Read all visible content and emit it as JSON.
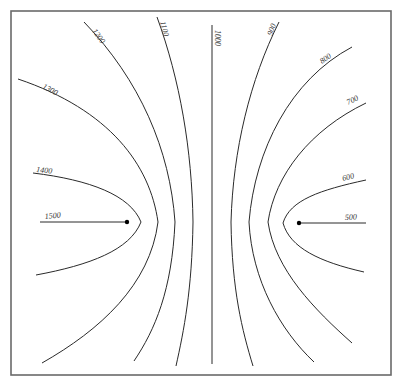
{
  "diagram": {
    "type": "contour-map",
    "frame": {
      "x": 11,
      "y": 11,
      "width": 380,
      "height": 364,
      "color": "#6a6a6a"
    },
    "line_color": "#2a2a2a",
    "points": [
      {
        "name": "left-source",
        "x": 127,
        "y": 222
      },
      {
        "name": "right-source",
        "x": 299,
        "y": 223
      }
    ],
    "contours": [
      {
        "value": "1500",
        "label": "1500",
        "d": "M40 222 L127 222",
        "label_pos": [
          45,
          219
        ],
        "label_rot": -6
      },
      {
        "value": "1400",
        "label": "1400",
        "d": "M33 173 C90 180 130 195 141 222 C130 250 90 265 36 275",
        "label_pos": [
          36,
          172
        ],
        "label_rot": 6
      },
      {
        "value": "1300",
        "label": "1300",
        "d": "M18 79 C110 110 150 165 158 222 C150 285 100 330 42 363",
        "label_pos": [
          42,
          88
        ],
        "label_rot": 28
      },
      {
        "value": "1200",
        "label": "1200",
        "d": "M84 22 C140 80 170 150 175 222 C172 290 155 330 134 361",
        "label_pos": [
          92,
          31
        ],
        "label_rot": 55
      },
      {
        "value": "1100",
        "label": "1100",
        "d": "M157 17 C180 80 192 150 193 222 C192 290 184 330 176 366",
        "label_pos": [
          160,
          22
        ],
        "label_rot": 75
      },
      {
        "value": "1000",
        "label": "1000",
        "d": "M212 25 L212 364",
        "label_pos": [
          215,
          30
        ],
        "label_rot": 90
      },
      {
        "value": "900",
        "label": "900",
        "d": "M279 22 C250 80 233 150 231 222 C232 290 242 330 253 366",
        "label_pos": [
          272,
          36
        ],
        "label_rot": -70
      },
      {
        "value": "800",
        "label": "800",
        "d": "M352 47 C290 80 255 150 249 222 C252 280 280 330 314 362",
        "label_pos": [
          322,
          64
        ],
        "label_rot": -35
      },
      {
        "value": "700",
        "label": "700",
        "d": "M366 103 C310 130 275 175 268 222 C275 270 315 310 352 343",
        "label_pos": [
          348,
          105
        ],
        "label_rot": -25
      },
      {
        "value": "600",
        "label": "600",
        "d": "M366 180 C320 190 290 200 283 223 C290 248 320 262 364 272",
        "label_pos": [
          343,
          181
        ],
        "label_rot": -15
      },
      {
        "value": "500",
        "label": "500",
        "d": "M299 223 L366 223",
        "label_pos": [
          345,
          220
        ],
        "label_rot": -3
      }
    ]
  }
}
